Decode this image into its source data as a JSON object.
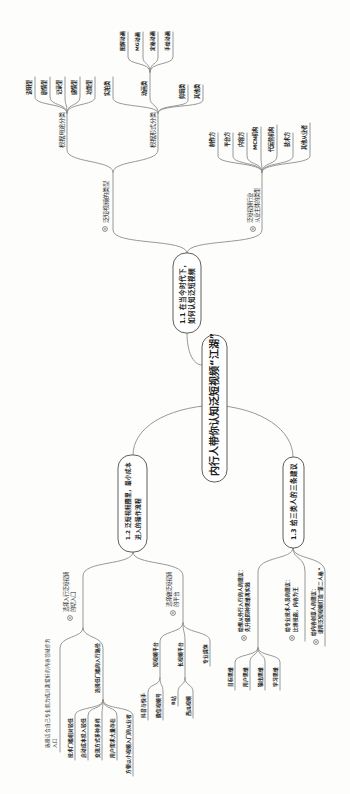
{
  "root": {
    "label": "内行人带你认知泛短视频“江湖”"
  },
  "section_1_1": {
    "lines": [
      "1.1 在当今时代下，",
      "如何认知泛短视频"
    ],
    "types": {
      "label": "泛短视频的类型",
      "by_use": {
        "label": "根据用途分类",
        "leaves": [
          "说明型",
          "剧情型",
          "记录型",
          "感情型",
          "功能型"
        ]
      },
      "by_form": {
        "label": "根据形式分类",
        "children": [
          {
            "label": "实拍类"
          },
          {
            "label": "动画类",
            "leaves": [
              "图解动画",
              "MG动画",
              "定格动画",
              "手绘动画"
            ]
          },
          {
            "label": "剪辑类"
          },
          {
            "label": "其他类"
          }
        ]
      }
    },
    "players": {
      "lines": [
        "泛短视频行业",
        "从业主体的类型"
      ],
      "leaves": [
        "制作方",
        "平台方",
        "内容方",
        "MCN机构",
        "代运营机构",
        "技术方",
        "其他从业者"
      ]
    }
  },
  "section_1_2": {
    "lines": [
      "1.2 泛短视频圈里，最小成本",
      "进入的操作流程"
    ],
    "entry": {
      "lines": [
        "选择入行泛短视频",
        "的切入口"
      ],
      "children": [
        {
          "lines": [
            "选择适合自己专业能力或兴趣爱好的内容领域作为",
            "入口"
          ]
        },
        {
          "label": "选择低门槛的入行路径",
          "leaves": [
            "技术门槛相对较低",
            "启动成本投入较低",
            "变现方式多种多样",
            "用户需求大量存在",
            "方便以小视频入门的从业者"
          ]
        }
      ]
    },
    "platform": {
      "lines": [
        "选择做泛短视频",
        "的平台"
      ],
      "children": [
        {
          "label": "短视频平台",
          "leaves": [
            "抖音与快手",
            "微信视频号"
          ]
        },
        {
          "label": "长视频平台",
          "leaves": [
            "B站",
            "西瓜视频"
          ]
        },
        {
          "label": "专业媒体"
        }
      ]
    }
  },
  "section_1_3": {
    "label": "1.3 给三类人的三条建议",
    "advice": [
      {
        "lines": [
          "给想从外行入行的人的建议：",
          "先升级四种思维再实践"
        ],
        "leaves": [
          "目标思维",
          "用户思维",
          "输出思维",
          "学习思维"
        ]
      },
      {
        "lines": [
          "给专业技术人员的建议：",
          "比拼技能，内容为王"
        ]
      },
      {
        "lines": [
          "给内容创意人的建议：",
          "请用泛短视频打造“第二人格”"
        ]
      }
    ]
  },
  "colors": {
    "connector": "#8c8c8c",
    "node_border": "#4d4d4d",
    "text": "#1e1e1e",
    "background": "#fdfdfc"
  }
}
